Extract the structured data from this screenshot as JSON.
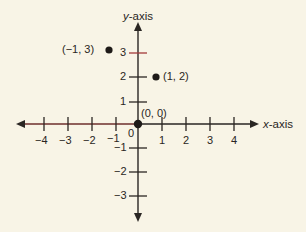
{
  "diagram": {
    "type": "coordinate-plane",
    "origin_label": "(0, 0)",
    "zero_label": "0",
    "x_axis": {
      "var": "x",
      "suffix": "-axis",
      "ticks": [
        -4,
        -3,
        -2,
        -1,
        1,
        2,
        3,
        4
      ],
      "tick_labels": [
        "−4",
        "−3",
        "−2",
        "−1",
        "1",
        "2",
        "3",
        "4"
      ]
    },
    "y_axis": {
      "var": "y",
      "suffix": "-axis",
      "ticks": [
        3,
        2,
        1,
        -1,
        -2,
        -3
      ],
      "tick_labels": [
        "3",
        "2",
        "1",
        "−1",
        "−2",
        "−3"
      ]
    },
    "points": [
      {
        "x": -1,
        "y": 3,
        "label": "(−1, 3)"
      },
      {
        "x": 1,
        "y": 2,
        "label": "(1, 2)"
      },
      {
        "x": 0,
        "y": 0,
        "label": "(0, 0)"
      }
    ],
    "colors": {
      "background": "#f8f4e6",
      "axis": "#2a2623",
      "axis_accent": "#7a2a2a",
      "tick_accent": "#a33a3a",
      "point": "#1e1a18"
    }
  }
}
